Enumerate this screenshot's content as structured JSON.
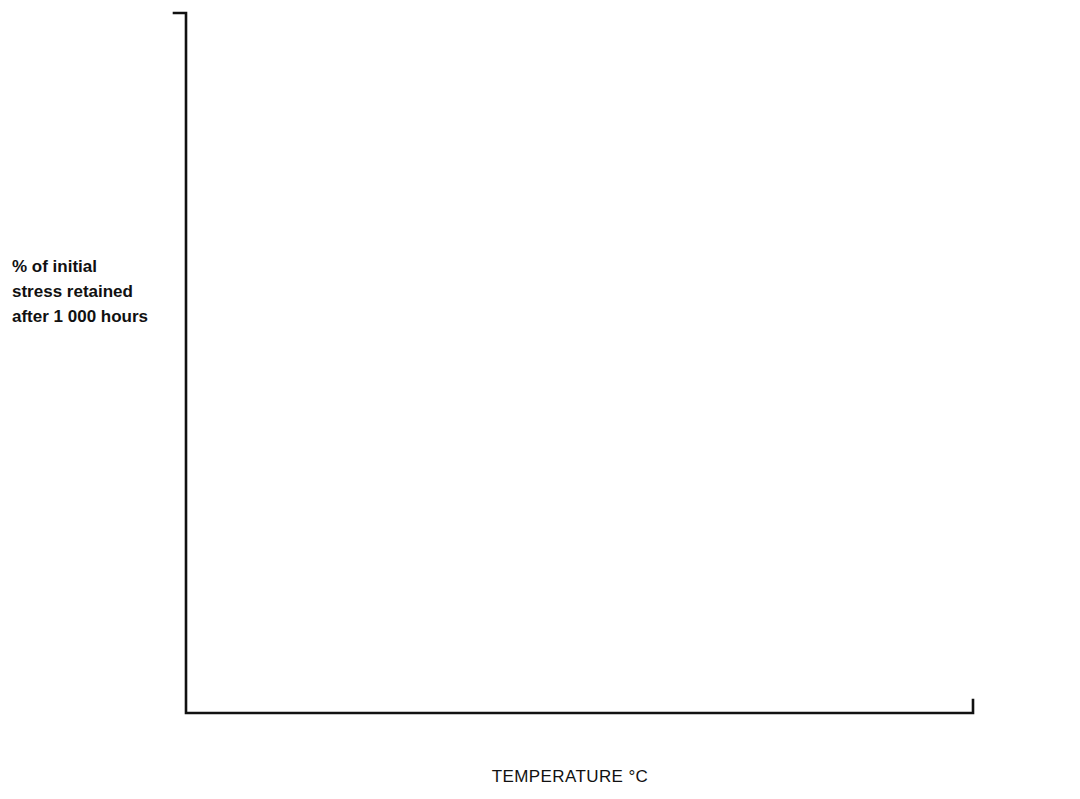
{
  "chart_data": {
    "type": "line",
    "title": "",
    "xlabel": "TEMPERATURE °C",
    "ylabel": "% of initial stress retained after 1 000 hours",
    "ylabel_lines": [
      "% of initial",
      "stress retained",
      "after 1 000 hours"
    ],
    "xlim": [
      0,
      800
    ],
    "ylim": [
      0,
      100
    ],
    "xticks": [
      0,
      100,
      200,
      300,
      400,
      500,
      600,
      700,
      800
    ],
    "xtick_labels": [
      "0",
      "100",
      "200",
      "300",
      "400",
      "500",
      "600",
      "700",
      "800"
    ],
    "yticks": [
      25,
      50,
      75,
      100
    ],
    "ytick_labels": [
      "25",
      "50",
      "75",
      "100"
    ],
    "yminor_ticks": [
      12.5,
      37.5,
      62.5,
      87.5
    ],
    "grid": false,
    "legend_position": "inline-annotations",
    "series": [
      {
        "name": "18/8 Stainless Steel",
        "label": "18/8 Stainless Steel",
        "label_x": 460,
        "label_y": 57,
        "label_style": "normal",
        "x": [
          20,
          290,
          400,
          500,
          545,
          600,
          645,
          700
        ],
        "y": [
          93.1,
          91.3,
          85.0,
          73.5,
          71.5,
          61.5,
          33.0,
          0.6
        ]
      },
      {
        "name": "25 Ni, 15 Cr steel AISI 660",
        "label": "25 Ni, 15 Cr steel AISI 660",
        "label_x": 735,
        "label_y": 126,
        "label_style": "normal",
        "x": [
          22,
          295,
          390,
          500,
          545,
          600,
          640,
          648
        ],
        "y": [
          95.0,
          91.5,
          84.0,
          72.0,
          71.0,
          62.0,
          21.5,
          17.5
        ]
      },
      {
        "name": "18/10/3 Stainless Steel",
        "label": "18/10/3 Stainless Steel",
        "label_lines": [
          "18/10/3",
          "Stainless Steel"
        ],
        "label_x": 657,
        "label_y": 308,
        "label_style": "normal",
        "x": [
          190,
          480,
          553,
          610,
          645,
          655
        ],
        "y": [
          91.3,
          91.3,
          87.5,
          68.5,
          40.0,
          16.5
        ]
      },
      {
        "name": "Nickel–Chromium Alloy Nomonic 80A",
        "label": "Nickel–Chromium Alloy Nomonic 80A",
        "label_lines": [
          "Nickel–Chromium Alloy",
          "Nomonic 80A"
        ],
        "label_x": 928,
        "label_y": 528,
        "label_style": "normal",
        "x": [
          647,
          750
        ],
        "y": [
          52.5,
          21.0
        ]
      },
      {
        "name": "Carbon Steel",
        "label": "Carbon Steel",
        "label_x": 440,
        "label_y": 641,
        "label_style": "bold",
        "x": [
          15,
          90,
          290,
          300,
          400
        ],
        "y": [
          92.8,
          81.5,
          80.0,
          71.5,
          9.0
        ]
      },
      {
        "name": "1% Cr-Mo Steel",
        "label": "1% Cr-Mo Steel",
        "label_lines": [
          "1% Cr-Mo",
          "Steel"
        ],
        "label_x": 637,
        "label_y": 658,
        "label_style": "normal",
        "x": [
          18,
          290,
          440,
          450,
          510
        ],
        "y": [
          93.5,
          76.0,
          36.0,
          6.0,
          1.8
        ]
      },
      {
        "name": "1% Cr-Mo-V Steel",
        "label": "1% Cr-Mo-V Steel",
        "label_x": 728,
        "label_y": 671,
        "label_style": "normal",
        "x": [
          20,
          295,
          400,
          500,
          545
        ],
        "y": [
          94.0,
          75.5,
          65.0,
          36.0,
          3.0
        ]
      }
    ]
  },
  "axis": {
    "x_title": "TEMPERATURE °C",
    "y_caption_line1": "% of initial",
    "y_caption_line2": "stress retained",
    "y_caption_line3": "after 1 000 hours"
  },
  "colors": {
    "ink": "#1a1a1a",
    "background": "#ffffff"
  }
}
